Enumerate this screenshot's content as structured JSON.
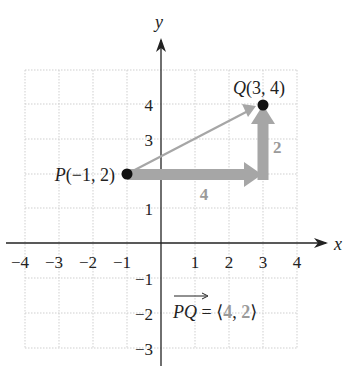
{
  "axes": {
    "x_label": "x",
    "y_label": "y",
    "x_ticks": [
      "−4",
      "−3",
      "−2",
      "−1",
      "1",
      "2",
      "3",
      "4"
    ],
    "y_ticks_pos": [
      "1",
      "3",
      "4"
    ],
    "y_ticks_neg": [
      "−1",
      "−2",
      "−3"
    ]
  },
  "points": {
    "P": {
      "label": "P(−1, 2)",
      "x": -1,
      "y": 2
    },
    "Q": {
      "label": "Q(3, 4)",
      "x": 3,
      "y": 4
    }
  },
  "components": {
    "horizontal_label": "4",
    "vertical_label": "2"
  },
  "equation": {
    "vector_name": "PQ",
    "equals": " = ⟨",
    "comp1": "4",
    "sep": ", ",
    "comp2": "2",
    "close": "⟩"
  },
  "colors": {
    "component_arrow": "#a6a6a6",
    "vector_arrow": "#a6a6a6",
    "axis": "#222222",
    "grid": "#cccccc",
    "component_label": "#999999"
  }
}
